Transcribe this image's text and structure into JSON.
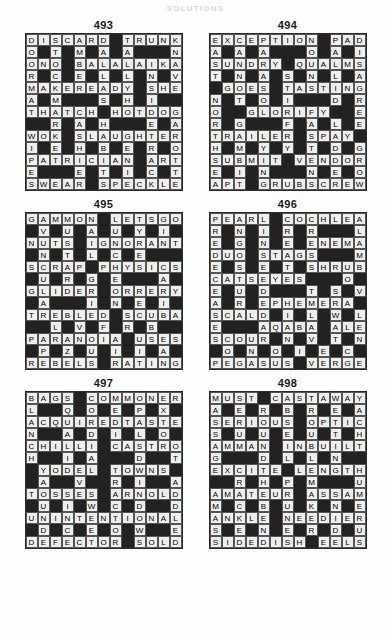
{
  "page": {
    "header": "SOLUTIONS",
    "background_color": "#fdfdfd",
    "block_color": "#222222",
    "light_cell_color": "#eeeeec",
    "grid_line_color": "#555555",
    "rows": 13,
    "columns": 13
  },
  "puzzles": [
    {
      "number": "493",
      "grid": [
        "DISCARD#TRUNK",
        "O#T#M#A#A###N",
        "ONO#BALALAIKA",
        "R#C#E#L#L#N#V",
        "MAKEREADY#SHE",
        "A#M###S#H#I##",
        "THATCH#HOTDOG",
        "##R#A#H###E#A",
        "WOK#SLAUGHTER",
        "I#E#H#B#E#R#O",
        "PATRICIAN#ART",
        "E###E#T#I#C#T",
        "SWEAR#SPECKLE"
      ],
      "across_answers": [
        "DISCARD",
        "TRUNK",
        "ONO",
        "BALALAIKA",
        "MAKEREADY",
        "SHE",
        "THATCH",
        "HOTDOG",
        "WOK",
        "SLAUGHTER",
        "PATRICIAN",
        "ART",
        "SWEAR",
        "SPECKLE"
      ],
      "down_answers": [
        "DOOR",
        "MA",
        "STITCH",
        "CELEB",
        "ANTHEM",
        "SHE",
        "MALL",
        "HATE",
        "AIR",
        "NAVE",
        "RAH",
        "WIPE",
        "ERA",
        "CAT",
        "ROTE"
      ]
    },
    {
      "number": "494",
      "grid": [
        "EXCEPTION#PAD",
        "A#A#A###O#A#I",
        "SUNDRY#QUALMS",
        "T#N#A#S#N#L#A",
        "#GOES#TASTING",
        "N#T#O#I###D#R",
        "O##GLORIFY##E",
        "R#G###F#A#L#E",
        "TRAILER#SPAY#",
        "H#M#Y#Y#T#D#G",
        "SUBMIT#VENDOR",
        "E#I#N###N#E#O",
        "APT#GRUBSCREW"
      ],
      "across_answers": [
        "EXCEPTION",
        "PAD",
        "SUNDRY",
        "QUALMS",
        "GOES",
        "TASTING",
        "GLORIFY",
        "TRAILER",
        "SPAY",
        "SUBMIT",
        "VENDOR",
        "APT",
        "GRUBSCREW"
      ],
      "down_answers": [
        "EAST",
        "NORTHSE",
        "SUNDAY",
        "GOT",
        "PAL",
        "MSA",
        "IGRE"
      ]
    },
    {
      "number": "495",
      "grid": [
        "GAMMON#LETSGO",
        "#V#U#A#U#Y#I#",
        "NUTS#IGNORANT",
        "#N#T#L#C#E###",
        "SCRAP#PHYSICS",
        "#U#R#G#E###A#",
        "GLIDER#ORRERY",
        "#A###I#N#E#I#",
        "TREBLED#SCUBA",
        "##L#V#F#R#B##",
        "PARANOIA#USES",
        "#P#Z#U#I#I#A#",
        "REBELS#RATING"
      ],
      "across_answers": [
        "GAMMON",
        "LETSGO",
        "NUTS",
        "IGNORANT",
        "SCRAP",
        "PHYSICS",
        "GLIDER",
        "ORRERY",
        "TREBLED",
        "SCUBA",
        "PARANOIA",
        "USES",
        "REBELS",
        "RATING"
      ],
      "down_answers": [
        "GUN",
        "AVAIL",
        "MUTTER",
        "SCRAP",
        "PUZZLE"
      ]
    },
    {
      "number": "496",
      "grid": [
        "PEARL#COCHLEA",
        "R#N#I#R#R###L",
        "E#G#N#E#ENEMA",
        "DUO#STAGS###M",
        "E#S#E#T#SHRUB",
        "CATSEYES###O#",
        "E#U#D###T#S#V",
        "A#R#EPHEMERA#",
        "SCALD#I#L#W#L",
        "E###AQABA#ALE",
        "SCOUR#N#V#T#N",
        "#O#N#O#I#E#C#",
        "PEGASUS#VERGE"
      ],
      "across_answers": [
        "PEARL",
        "COCHLEA",
        "ENEMA",
        "DUO",
        "STAGS",
        "SHRUB",
        "CATSEYES",
        "EPHEMERA",
        "SCALD",
        "AQABA",
        "ALE",
        "SCOUR",
        "PEGASUS",
        "VERGE"
      ],
      "down_answers": [
        "PREDECAS",
        "ENGUR",
        "CONE",
        "SHREW",
        "ALE"
      ]
    },
    {
      "number": "497",
      "grid": [
        "BAGS#COMMONER",
        "L##Q#O#E#P#X#",
        "ACQUIREDTASTE",
        "N##A#D#I#L#O#",
        "CHILLI#CASTRO",
        "H##I#A###D##T",
        "#YODEL#TOWNS#",
        "#A##V##R#I##A",
        "TOSSES#ARNOLD",
        "#U#I#W#C#D##D",
        "UNINTENTIONAL",
        "#D#C#E#O#W##E",
        "DEFECTOR#SOLD"
      ],
      "across_answers": [
        "BAGS",
        "COMMONER",
        "ACQUIREDTASTE",
        "CHILLI",
        "CASTRO",
        "YODEL",
        "TOWNS",
        "TOSSES",
        "ARNOLD",
        "UNINTENTIONAL",
        "DEFECTOR",
        "SOLD"
      ],
      "down_answers": [
        "BLANCH",
        "ACQUAINT",
        "GQODI",
        "SOLDIER"
      ]
    },
    {
      "number": "498",
      "grid": [
        "MUST#CASTAWAY",
        "A#E#R#B#R#E#A",
        "SERIOUS#OPTIC",
        "S#U#U#E#U#T#H",
        "AMMAN#INBUILT",
        "G###D#L#L#N##",
        "EXCITE#LENGTH",
        "##R#H#P#M###U",
        "AMATEUR#ASSAM",
        "M#C#B#U#K#N#E",
        "ANKLE#NEEDIER",
        "S#E#N#E#R#D#U",
        "SIDEDISH#EELS"
      ],
      "across_answers": [
        "MUST",
        "CASTAWAY",
        "SERIOUS",
        "OPTIC",
        "AMMAN",
        "INBUILT",
        "EXCITE",
        "LENGTH",
        "AMATEUR",
        "ASSAM",
        "ANKLE",
        "NEEDIER",
        "SIDEDISH",
        "EELS"
      ],
      "down_answers": [
        "MASSAGE",
        "USURER",
        "CASTLE",
        "OPTICAL",
        "AYACHT"
      ]
    }
  ]
}
